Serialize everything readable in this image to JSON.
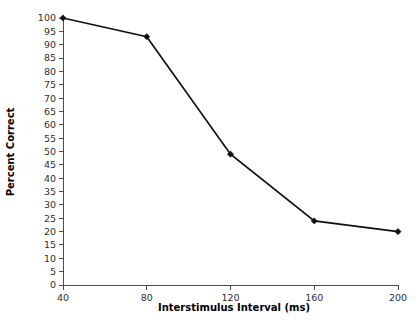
{
  "chart_data": {
    "type": "line",
    "title": "",
    "xlabel": "Interstimulus Interval (ms)",
    "ylabel": "Percent Correct",
    "x": [
      40,
      80,
      120,
      160,
      200
    ],
    "values": [
      100,
      93,
      49,
      24,
      20
    ],
    "series": [
      {
        "name": "Percent Correct",
        "x": [
          40,
          80,
          120,
          160,
          200
        ],
        "values": [
          100,
          93,
          49,
          24,
          20
        ]
      }
    ],
    "xlim": [
      40,
      200
    ],
    "ylim": [
      0,
      100
    ],
    "xticks": [
      40,
      80,
      120,
      160,
      200
    ],
    "xtick_labels": [
      "40",
      "80",
      "120",
      "160",
      "200"
    ],
    "yticks": [
      0,
      5,
      10,
      15,
      20,
      25,
      30,
      35,
      40,
      45,
      50,
      55,
      60,
      65,
      70,
      75,
      80,
      85,
      90,
      95,
      100
    ],
    "ytick_labels": [
      "0",
      "5",
      "10",
      "15",
      "20",
      "25",
      "30",
      "35",
      "40",
      "45",
      "50",
      "55",
      "60",
      "65",
      "70",
      "75",
      "80",
      "85",
      "90",
      "95",
      "100"
    ],
    "grid": false,
    "legend": false,
    "legend_position": "none",
    "line_color": "#111111",
    "marker": "diamond",
    "marker_color": "#111111",
    "axis_color": "#4d4d4d",
    "background_color": "#ffffff"
  }
}
